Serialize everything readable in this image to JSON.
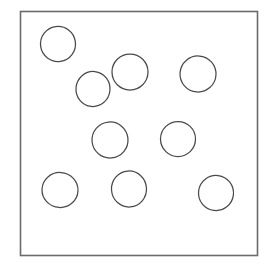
{
  "figure": {
    "kind": "line-drawing",
    "background_color": "#ffffff",
    "canvas": {
      "width": 268,
      "height": 264
    }
  },
  "frame": {
    "label": "square-boundary",
    "stroke_color": "#6b6b6b",
    "stroke_width": 1.6,
    "fill": "none",
    "x": 20.5,
    "y": 11.5,
    "width": 237,
    "height": 244
  },
  "shapes": {
    "count": 9,
    "type": "circle",
    "stroke_color": "#4a4a4a",
    "stroke_width": 1.25,
    "fill": "none",
    "items": [
      {
        "id": "circle-1",
        "cx": 58,
        "cy": 44,
        "rx": 17.5,
        "ry": 17.5,
        "rotation": -8
      },
      {
        "id": "circle-2",
        "cx": 93,
        "cy": 89,
        "rx": 17.0,
        "ry": 17.5,
        "rotation": 6
      },
      {
        "id": "circle-3",
        "cx": 130,
        "cy": 72,
        "rx": 18.0,
        "ry": 18.0,
        "rotation": 0
      },
      {
        "id": "circle-4",
        "cx": 198,
        "cy": 74,
        "rx": 18.0,
        "ry": 18.0,
        "rotation": 4
      },
      {
        "id": "circle-5",
        "cx": 110,
        "cy": 140,
        "rx": 18.0,
        "ry": 18.0,
        "rotation": -5
      },
      {
        "id": "circle-6",
        "cx": 178,
        "cy": 139,
        "rx": 17.5,
        "ry": 17.5,
        "rotation": 0
      },
      {
        "id": "circle-7",
        "cx": 60,
        "cy": 190,
        "rx": 18.0,
        "ry": 17.5,
        "rotation": 3
      },
      {
        "id": "circle-8",
        "cx": 129,
        "cy": 189,
        "rx": 17.5,
        "ry": 18.0,
        "rotation": -4
      },
      {
        "id": "circle-9",
        "cx": 216,
        "cy": 193,
        "rx": 17.5,
        "ry": 17.5,
        "rotation": 7
      }
    ]
  }
}
